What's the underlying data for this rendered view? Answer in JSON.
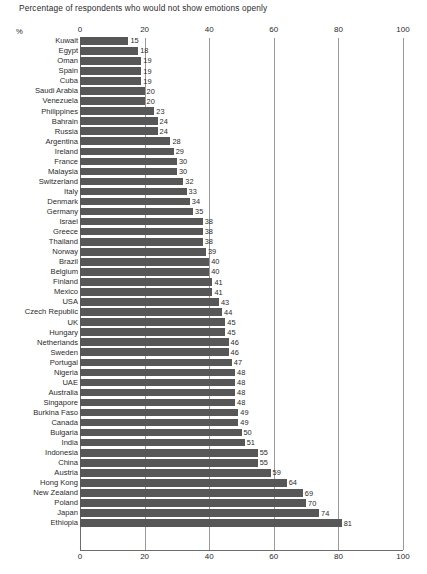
{
  "chart_data": {
    "type": "bar",
    "orientation": "horizontal",
    "title": "Percentage of respondents who would not show emotions openly",
    "xlabel": "%",
    "ylabel": "",
    "unit_symbol": "%",
    "xlim": [
      0,
      100
    ],
    "xticks": [
      0,
      20,
      40,
      60,
      80,
      100
    ],
    "xtick_labels": [
      "0",
      "20",
      "40",
      "60",
      "80",
      "100"
    ],
    "grid": "vertical",
    "legend": null,
    "bar_color": "#575757",
    "gridline_color": "#9a9a9a",
    "axis_color": "#6d6d6d",
    "text_color": "#2b2b2b",
    "categories": [
      "Kuwait",
      "Egypt",
      "Oman",
      "Spain",
      "Cuba",
      "Saudi Arabia",
      "Venezuela",
      "Philippines",
      "Bahrain",
      "Russia",
      "Argentina",
      "Ireland",
      "France",
      "Malaysia",
      "Switzerland",
      "Italy",
      "Denmark",
      "Germany",
      "Israel",
      "Greece",
      "Thailand",
      "Norway",
      "Brazil",
      "Belgium",
      "Finland",
      "Mexico",
      "USA",
      "Czech Republic",
      "UK",
      "Hungary",
      "Netherlands",
      "Sweden",
      "Portugal",
      "Nigeria",
      "UAE",
      "Australia",
      "Singapore",
      "Burkina Faso",
      "Canada",
      "Bulgaria",
      "India",
      "Indonesia",
      "China",
      "Austria",
      "Hong Kong",
      "New Zealand",
      "Poland",
      "Japan",
      "Ethiopia"
    ],
    "values": [
      15,
      18,
      19,
      19,
      19,
      20,
      20,
      23,
      24,
      24,
      28,
      29,
      30,
      30,
      32,
      33,
      34,
      35,
      38,
      38,
      38,
      39,
      40,
      40,
      41,
      41,
      43,
      44,
      45,
      45,
      46,
      46,
      47,
      48,
      48,
      48,
      48,
      49,
      49,
      50,
      51,
      55,
      55,
      59,
      64,
      69,
      70,
      74,
      81
    ]
  }
}
